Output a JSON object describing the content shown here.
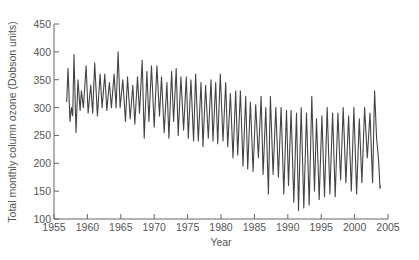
{
  "chart_data": {
    "type": "line",
    "title": "",
    "xlabel": "Year",
    "ylabel": "Total monthly column ozone (Dobson units)",
    "xlim": [
      1955,
      2005
    ],
    "ylim": [
      100,
      450
    ],
    "x_ticks": [
      1955,
      1960,
      1965,
      1970,
      1975,
      1980,
      1985,
      1990,
      1995,
      2000,
      2005
    ],
    "y_ticks": [
      100,
      150,
      200,
      250,
      300,
      350,
      400,
      450
    ],
    "grid": false,
    "legend": null,
    "series": [
      {
        "name": "Total monthly column ozone",
        "color": "#444444",
        "points": [
          [
            1956.9,
            310
          ],
          [
            1957.1,
            370
          ],
          [
            1957.4,
            275
          ],
          [
            1957.6,
            300
          ],
          [
            1957.8,
            285
          ],
          [
            1958.0,
            395
          ],
          [
            1958.3,
            255
          ],
          [
            1958.6,
            350
          ],
          [
            1958.9,
            295
          ],
          [
            1959.1,
            330
          ],
          [
            1959.4,
            300
          ],
          [
            1959.8,
            375
          ],
          [
            1960.1,
            290
          ],
          [
            1960.5,
            340
          ],
          [
            1960.8,
            290
          ],
          [
            1961.1,
            380
          ],
          [
            1961.5,
            285
          ],
          [
            1961.9,
            360
          ],
          [
            1962.2,
            300
          ],
          [
            1962.6,
            360
          ],
          [
            1962.9,
            295
          ],
          [
            1963.3,
            345
          ],
          [
            1963.6,
            300
          ],
          [
            1964.0,
            360
          ],
          [
            1964.3,
            300
          ],
          [
            1964.6,
            400
          ],
          [
            1964.9,
            300
          ],
          [
            1965.3,
            350
          ],
          [
            1965.7,
            275
          ],
          [
            1966.0,
            355
          ],
          [
            1966.4,
            280
          ],
          [
            1966.8,
            340
          ],
          [
            1967.1,
            270
          ],
          [
            1967.5,
            355
          ],
          [
            1967.8,
            290
          ],
          [
            1968.2,
            385
          ],
          [
            1968.5,
            245
          ],
          [
            1968.9,
            365
          ],
          [
            1969.2,
            275
          ],
          [
            1969.6,
            375
          ],
          [
            1970.0,
            265
          ],
          [
            1970.4,
            375
          ],
          [
            1970.8,
            285
          ],
          [
            1971.1,
            355
          ],
          [
            1971.5,
            255
          ],
          [
            1971.9,
            345
          ],
          [
            1972.2,
            245
          ],
          [
            1972.6,
            365
          ],
          [
            1972.9,
            275
          ],
          [
            1973.3,
            370
          ],
          [
            1973.6,
            250
          ],
          [
            1974.0,
            355
          ],
          [
            1974.4,
            260
          ],
          [
            1974.8,
            355
          ],
          [
            1975.1,
            245
          ],
          [
            1975.5,
            350
          ],
          [
            1975.9,
            240
          ],
          [
            1976.2,
            360
          ],
          [
            1976.6,
            240
          ],
          [
            1977.0,
            345
          ],
          [
            1977.3,
            230
          ],
          [
            1977.7,
            340
          ],
          [
            1978.1,
            245
          ],
          [
            1978.5,
            350
          ],
          [
            1978.8,
            240
          ],
          [
            1979.2,
            345
          ],
          [
            1979.5,
            235
          ],
          [
            1979.9,
            360
          ],
          [
            1980.3,
            240
          ],
          [
            1980.7,
            345
          ],
          [
            1981.0,
            230
          ],
          [
            1981.4,
            325
          ],
          [
            1981.8,
            210
          ],
          [
            1982.2,
            330
          ],
          [
            1982.5,
            215
          ],
          [
            1982.9,
            330
          ],
          [
            1983.3,
            195
          ],
          [
            1983.7,
            320
          ],
          [
            1984.0,
            190
          ],
          [
            1984.4,
            310
          ],
          [
            1984.8,
            185
          ],
          [
            1985.2,
            305
          ],
          [
            1985.6,
            210
          ],
          [
            1986.0,
            320
          ],
          [
            1986.3,
            180
          ],
          [
            1986.7,
            300
          ],
          [
            1987.1,
            145
          ],
          [
            1987.4,
            320
          ],
          [
            1987.8,
            180
          ],
          [
            1988.2,
            300
          ],
          [
            1988.6,
            175
          ],
          [
            1989.0,
            300
          ],
          [
            1989.4,
            145
          ],
          [
            1989.8,
            295
          ],
          [
            1990.1,
            160
          ],
          [
            1990.5,
            295
          ],
          [
            1990.9,
            130
          ],
          [
            1991.3,
            290
          ],
          [
            1991.6,
            115
          ],
          [
            1992.0,
            300
          ],
          [
            1992.4,
            120
          ],
          [
            1992.8,
            290
          ],
          [
            1993.2,
            125
          ],
          [
            1993.6,
            320
          ],
          [
            1994.0,
            150
          ],
          [
            1994.3,
            280
          ],
          [
            1994.7,
            135
          ],
          [
            1995.1,
            285
          ],
          [
            1995.5,
            140
          ],
          [
            1995.9,
            300
          ],
          [
            1996.3,
            145
          ],
          [
            1996.7,
            290
          ],
          [
            1997.1,
            140
          ],
          [
            1997.5,
            290
          ],
          [
            1997.9,
            170
          ],
          [
            1998.3,
            300
          ],
          [
            1998.7,
            165
          ],
          [
            1999.1,
            285
          ],
          [
            1999.5,
            150
          ],
          [
            1999.9,
            300
          ],
          [
            2000.3,
            145
          ],
          [
            2000.7,
            280
          ],
          [
            2001.1,
            165
          ],
          [
            2001.5,
            300
          ],
          [
            2001.9,
            210
          ],
          [
            2002.3,
            290
          ],
          [
            2002.7,
            165
          ],
          [
            2003.0,
            330
          ],
          [
            2003.3,
            245
          ],
          [
            2003.6,
            205
          ],
          [
            2003.8,
            155
          ],
          [
            2003.9,
            160
          ]
        ]
      }
    ]
  }
}
